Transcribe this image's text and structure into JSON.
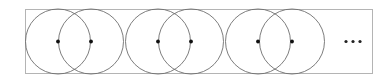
{
  "figure": {
    "title": "",
    "caption": "",
    "background_color": "#ffffff",
    "canvas": {
      "width": 386,
      "height": 84
    },
    "frame": {
      "name": "bounding-rectangle",
      "x": 25.5,
      "y": 9.5,
      "width": 347,
      "height": 64,
      "stroke_color": "#b4b4b4",
      "stroke_width": 1,
      "fill": "none"
    },
    "circles": {
      "count": 6,
      "radius": 32.5,
      "center_y": 41.5,
      "stroke_color": "#6e6e6e",
      "stroke_width": 0.9,
      "fill": "none",
      "centers_x": [
        58,
        91,
        158,
        191,
        258,
        292
      ],
      "pairs": [
        {
          "label": "pair-1",
          "centers_x": [
            58,
            91
          ]
        },
        {
          "label": "pair-2",
          "centers_x": [
            158,
            191
          ]
        },
        {
          "label": "pair-3",
          "centers_x": [
            258,
            292
          ]
        }
      ]
    },
    "center_points": {
      "count": 6,
      "radius": 1.9,
      "color": "#111111",
      "positions": [
        {
          "x": 58,
          "y": 41.5
        },
        {
          "x": 91,
          "y": 41.5
        },
        {
          "x": 158,
          "y": 41.5
        },
        {
          "x": 191,
          "y": 41.5
        },
        {
          "x": 258,
          "y": 41.5
        },
        {
          "x": 292,
          "y": 41.5
        }
      ]
    },
    "ellipsis": {
      "name": "continuation-ellipsis",
      "text": "···",
      "x": 353,
      "y": 41.5,
      "color": "#222222",
      "dot_radius": 1.6,
      "dots": [
        {
          "x": 346,
          "y": 41.5
        },
        {
          "x": 353,
          "y": 41.5
        },
        {
          "x": 360,
          "y": 41.5
        }
      ]
    }
  }
}
